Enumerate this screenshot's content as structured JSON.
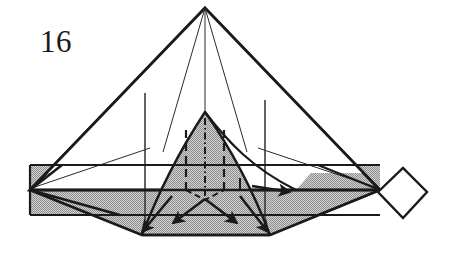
{
  "figure": {
    "kind": "origami-folding-step-diagram",
    "step_number": "16",
    "caption": "",
    "background_color": "#ffffff",
    "ink_color": "#1a1a1a",
    "paper_shaded_color": "#a8a8a8",
    "paper_white_color": "#ffffff",
    "canvas": {
      "width": 460,
      "height": 271
    }
  },
  "labels": {
    "step_number": "16"
  },
  "geometry": {
    "apex": {
      "x": 205,
      "y": 8
    },
    "band_left_x": 30,
    "band_right_x": 380,
    "band_top_y": 165,
    "band_mid_y": 190,
    "band_bottom_y": 215,
    "center_triangle_apex": {
      "x": 205,
      "y": 112
    },
    "center_triangle_left": {
      "x": 142,
      "y": 235
    },
    "center_triangle_right": {
      "x": 270,
      "y": 235
    },
    "diamond_points": "378,192 403,168 427,192 403,218",
    "left_vertical_line_x": 145,
    "right_vertical_line_x": 265
  },
  "fold_marks": {
    "center_line_style": "dash-dot",
    "side_line_style": "dashed",
    "valley_fold_count": 2,
    "mountain_fold_count": 1
  },
  "arrows": [
    {
      "name": "fold-arrow-down-left",
      "direction": "down-left"
    },
    {
      "name": "fold-arrow-down-right",
      "direction": "down-right"
    },
    {
      "name": "fold-arrow-outer-left",
      "direction": "down-left"
    },
    {
      "name": "fold-arrow-outer-right",
      "direction": "down-right"
    },
    {
      "name": "fold-arrow-right-horizontal",
      "direction": "right"
    }
  ]
}
